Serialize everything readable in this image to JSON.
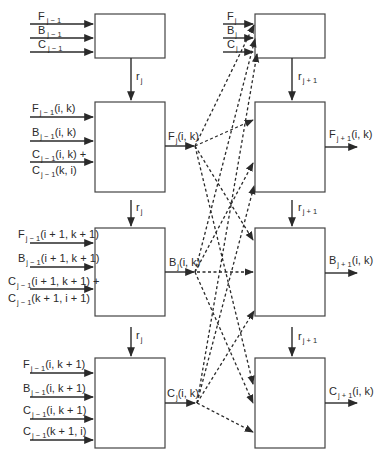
{
  "diagram": {
    "type": "dataflow",
    "left_column": {
      "top_box": {
        "inputs": [
          {
            "base": "F",
            "sub": "j − 1",
            "args": ""
          },
          {
            "base": "B",
            "sub": "j − 1",
            "args": ""
          },
          {
            "base": "C",
            "sub": "j − 1",
            "args": ""
          }
        ],
        "down_label": {
          "base": "r",
          "sub": "j"
        }
      },
      "boxes": [
        {
          "id": "F",
          "inputs": [
            {
              "base": "F",
              "sub": "j − 1",
              "args": "(i, k)"
            },
            {
              "base": "B",
              "sub": "j − 1",
              "args": "(i, k)"
            },
            {
              "base": "C",
              "sub": "j − 1",
              "args": "(i, k) +"
            },
            {
              "base": "C",
              "sub": "j − 1",
              "args": "(k, i)"
            }
          ],
          "output": {
            "base": "F",
            "sub": "j",
            "args": "(i, k)"
          },
          "down_label": {
            "base": "r",
            "sub": "j"
          }
        },
        {
          "id": "B",
          "inputs": [
            {
              "base": "F",
              "sub": "j − 1",
              "args": "(i + 1, k + 1)"
            },
            {
              "base": "B",
              "sub": "j − 1",
              "args": "(i + 1, k + 1)"
            },
            {
              "base": "C",
              "sub": "j − 1",
              "args": "(i + 1, k + 1) +"
            },
            {
              "base": "C",
              "sub": "j − 1",
              "args": "(k + 1, i + 1)"
            }
          ],
          "output": {
            "base": "B",
            "sub": "j",
            "args": "(i, k)"
          },
          "down_label": {
            "base": "r",
            "sub": "j"
          }
        },
        {
          "id": "C",
          "inputs": [
            {
              "base": "F",
              "sub": "j − 1",
              "args": "(i, k + 1)"
            },
            {
              "base": "B",
              "sub": "j − 1",
              "args": "(i, k + 1)"
            },
            {
              "base": "C",
              "sub": "j − 1",
              "args": "(i, k + 1)"
            },
            {
              "base": "C",
              "sub": "j − 1",
              "args": "(k + 1, i)"
            }
          ],
          "output": {
            "base": "C",
            "sub": "j",
            "args": "(i, k)"
          }
        }
      ]
    },
    "right_column": {
      "top_box": {
        "inputs": [
          {
            "base": "F",
            "sub": "j",
            "args": ""
          },
          {
            "base": "B",
            "sub": "j",
            "args": ""
          },
          {
            "base": "C",
            "sub": "j",
            "args": ""
          }
        ],
        "down_label": {
          "base": "r",
          "sub": "j + 1"
        }
      },
      "boxes": [
        {
          "id": "F",
          "output": {
            "base": "F",
            "sub": "j + 1",
            "args": "(i, k)"
          },
          "down_label": {
            "base": "r",
            "sub": "j + 1"
          }
        },
        {
          "id": "B",
          "output": {
            "base": "B",
            "sub": "j + 1",
            "args": "(i, k)"
          },
          "down_label": {
            "base": "r",
            "sub": "j + 1"
          }
        },
        {
          "id": "C",
          "output": {
            "base": "C",
            "sub": "j + 1",
            "args": "(i, k)"
          }
        }
      ]
    },
    "line_style": {
      "solid": "#2a2a2a",
      "dashed": "#2a2a2a"
    }
  }
}
